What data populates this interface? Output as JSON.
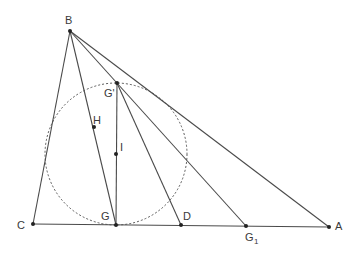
{
  "diagram": {
    "type": "geometry",
    "stroke_color": "#4a4a4a",
    "point_color": "#222222",
    "points": {
      "B": {
        "label": "B",
        "x": 70,
        "y": 31
      },
      "C": {
        "label": "C",
        "x": 33,
        "y": 224
      },
      "A": {
        "label": "A",
        "x": 329,
        "y": 227
      },
      "G": {
        "label": "G",
        "x": 116,
        "y": 225
      },
      "D": {
        "label": "D",
        "x": 181,
        "y": 225
      },
      "G1": {
        "label": "G",
        "sub": "1",
        "x": 246,
        "y": 226
      },
      "Gp": {
        "label": "G'",
        "x": 117,
        "y": 83
      },
      "H": {
        "label": "H",
        "x": 94,
        "y": 127
      },
      "I": {
        "label": "I",
        "x": 116,
        "y": 154
      }
    },
    "segments": [
      [
        "B",
        "C"
      ],
      [
        "B",
        "A"
      ],
      [
        "C",
        "A"
      ],
      [
        "B",
        "G"
      ],
      [
        "B",
        "G1"
      ],
      [
        "Gp",
        "G"
      ],
      [
        "Gp",
        "D"
      ]
    ],
    "circle": {
      "center": "I",
      "cx": 116,
      "cy": 154,
      "r": 71,
      "style": "dashed"
    }
  }
}
